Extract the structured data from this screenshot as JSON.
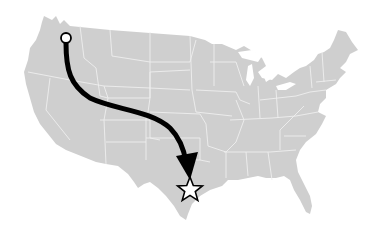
{
  "map": {
    "region": "Contiguous United States",
    "land_color": "#cfcfcf",
    "border_color": "#eeeeee",
    "background_color": "#ffffff"
  },
  "route": {
    "start_marker": {
      "shape": "circle",
      "fill": "#ffffff",
      "stroke": "#000000",
      "approx_location": "Washington State (Seattle area)"
    },
    "arrow": {
      "color": "#000000",
      "direction": "northwest to south-central"
    },
    "end_marker": {
      "shape": "star",
      "fill": "#ffffff",
      "stroke": "#000000",
      "approx_location": "East Texas (Houston area)"
    }
  }
}
